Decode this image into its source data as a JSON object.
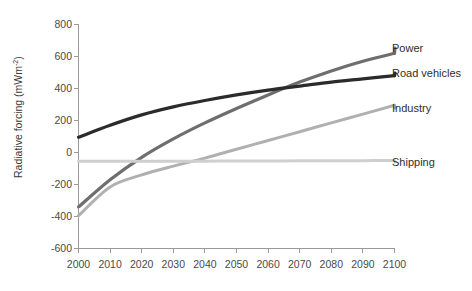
{
  "chart_data": {
    "type": "line",
    "title": "",
    "xlabel": "",
    "ylabel": "Radiative forcing (mWm",
    "ylabel_sup": "-2",
    "ylabel_close": ")",
    "xlim": [
      2000,
      2100
    ],
    "ylim": [
      -600,
      800
    ],
    "grid": false,
    "legend_position": "right-inline-labels",
    "xticks": [
      "2000",
      "2010",
      "2020",
      "2030",
      "2040",
      "2050",
      "2060",
      "2070",
      "2080",
      "2090",
      "2100"
    ],
    "xtick_values": [
      2000,
      2010,
      2020,
      2030,
      2040,
      2050,
      2060,
      2070,
      2080,
      2090,
      2100
    ],
    "yticks": [
      "800",
      "600",
      "400",
      "200",
      "0",
      "-200",
      "-400",
      "-600"
    ],
    "ytick_values": [
      800,
      600,
      400,
      200,
      0,
      -200,
      -400,
      -600
    ],
    "x": [
      2000,
      2010,
      2020,
      2030,
      2040,
      2050,
      2060,
      2070,
      2080,
      2090,
      2100
    ],
    "series": [
      {
        "name": "Power",
        "color": "#6e6e6e",
        "label": "Power",
        "values": [
          -340,
          -170,
          -30,
          85,
          185,
          275,
          360,
          440,
          510,
          570,
          620
        ]
      },
      {
        "name": "Road vehicles",
        "color": "#2b2b2b",
        "label": "Road vehicles",
        "values": [
          95,
          170,
          235,
          285,
          325,
          360,
          390,
          415,
          440,
          460,
          480
        ]
      },
      {
        "name": "Industry",
        "color": "#b0b0b0",
        "label": "Industry",
        "values": [
          -395,
          -215,
          -140,
          -85,
          -35,
          20,
          75,
          130,
          185,
          240,
          295
        ]
      },
      {
        "name": "Shipping",
        "color": "#cfcfcf",
        "label": "Shipping",
        "values": [
          -55,
          -55,
          -55,
          -54,
          -54,
          -53,
          -53,
          -52,
          -52,
          -51,
          -50
        ]
      }
    ]
  },
  "axis": {
    "y_title_main": "Radiative forcing (mWm",
    "y_title_sup": "-2",
    "y_title_end": ")"
  }
}
